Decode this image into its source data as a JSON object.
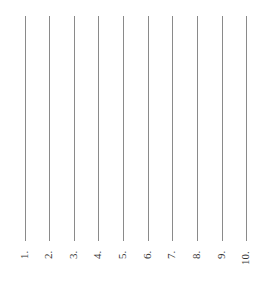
{
  "document": {
    "orientation": "rotated-90-ccw",
    "answer_lines": [
      {
        "label": "1.",
        "x": 25
      },
      {
        "label": "2.",
        "x": 49
      },
      {
        "label": "3.",
        "x": 74
      },
      {
        "label": "4.",
        "x": 98
      },
      {
        "label": "5.",
        "x": 123
      },
      {
        "label": "6.",
        "x": 148
      },
      {
        "label": "7.",
        "x": 172
      },
      {
        "label": "8.",
        "x": 197
      },
      {
        "label": "9.",
        "x": 222
      },
      {
        "label": "10.",
        "x": 246
      }
    ],
    "line_color": "#8a8a8a",
    "text_color": "#333333"
  }
}
